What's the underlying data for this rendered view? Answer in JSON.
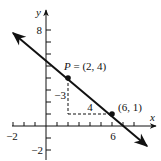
{
  "figure": {
    "type": "coordinate-graph",
    "axes": {
      "x_label": "x",
      "y_label": "y",
      "x_tick_labels": [
        {
          "value": -2,
          "text": "−2"
        },
        {
          "value": 6,
          "text": "6"
        }
      ],
      "y_tick_labels": [
        {
          "value": 8,
          "text": "8"
        },
        {
          "value": -2,
          "text": "−2"
        }
      ],
      "x_ticks": [
        -3,
        -2,
        -1,
        1,
        2,
        3,
        4,
        5,
        6,
        7,
        8
      ],
      "y_ticks": [
        -2,
        -1,
        1,
        2,
        3,
        4,
        5,
        6,
        7,
        8
      ]
    },
    "line": {
      "description": "line through (2,4) and (6,1), slope -3/4",
      "slope": "-3/4",
      "arrows": "both ends"
    },
    "points": [
      {
        "name": "P",
        "x": 2,
        "y": 4,
        "label": "P = (2, 4)"
      },
      {
        "name": "Q",
        "x": 6,
        "y": 1,
        "label": "(6, 1)"
      }
    ],
    "annotations": {
      "rise_label": "−3",
      "run_label": "4"
    },
    "colors": {
      "ink": "#111111",
      "background": "#ffffff"
    }
  }
}
